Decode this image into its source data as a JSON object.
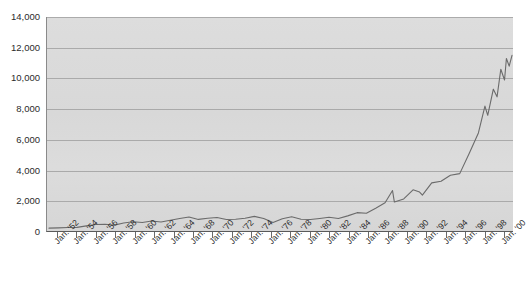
{
  "chart_data": {
    "type": "line",
    "title": "",
    "subtitle": "",
    "xlabel": "",
    "ylabel": "",
    "ylim": [
      0,
      14000
    ],
    "ytick_labels": [
      "0",
      "2,000",
      "4,000",
      "6,000",
      "8,000",
      "10,000",
      "12,000",
      "14,000"
    ],
    "ytick_values": [
      0,
      2000,
      4000,
      6000,
      8000,
      10000,
      12000,
      14000
    ],
    "grid": "horizontal",
    "legend": "none",
    "line_color": "#6b6b6b",
    "plot_background": "#dcdcdc",
    "axis_color": "#5a5a5a",
    "text_color": "#2b2b2b",
    "xtick_labels": [
      "Jan. '52",
      "Jan. '54",
      "Jan. '56",
      "Jan. '58",
      "Jan. '60",
      "Jan. '62",
      "Jan. '64",
      "Jan. '68",
      "Jan. '70",
      "Jan. '72",
      "Jan. '74",
      "Jan. '76",
      "Jan. '78",
      "Jan. '80",
      "Jan. '82",
      "Jan. '84",
      "Jan. '86",
      "Jan. '88",
      "Jan. '90",
      "Jan. '92",
      "Jan. '94",
      "Jan. '96",
      "Jan. '98",
      "Jan. '00"
    ],
    "x": [
      1951,
      1952,
      1953,
      1954,
      1955,
      1956,
      1957,
      1958,
      1959,
      1960,
      1961,
      1962,
      1963,
      1964,
      1965,
      1966,
      1967,
      1968,
      1969,
      1970,
      1971,
      1972,
      1973,
      1974,
      1975,
      1976,
      1977,
      1978,
      1979,
      1980,
      1981,
      1982,
      1983,
      1984,
      1985,
      1986,
      1987,
      1987.8,
      1988,
      1989,
      1990,
      1990.7,
      1991,
      1992,
      1993,
      1994,
      1995,
      1996,
      1997,
      1997.7,
      1998,
      1998.6,
      1999,
      1999.4,
      1999.8,
      2000,
      2000.3,
      2000.6
    ],
    "y": [
      250,
      270,
      290,
      300,
      400,
      490,
      500,
      450,
      590,
      670,
      620,
      720,
      650,
      760,
      880,
      980,
      820,
      900,
      940,
      810,
      830,
      900,
      1020,
      880,
      620,
      860,
      990,
      830,
      810,
      880,
      960,
      880,
      1050,
      1260,
      1220,
      1550,
      1900,
      2700,
      1950,
      2150,
      2750,
      2600,
      2400,
      3200,
      3300,
      3700,
      3800,
      5100,
      6450,
      8200,
      7600,
      9300,
      8800,
      10600,
      9900,
      11300,
      10800,
      11500
    ],
    "y_peak": 11500,
    "y_start": 250,
    "note": "Index level rises slowly from ~250 in the early 1950s to ~1,000 by the early 1970s, stays range-bound through the 1970s, then climbs steeply from the early 1980s, reaching roughly 11,500 by 2000."
  }
}
